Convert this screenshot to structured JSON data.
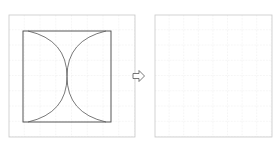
{
  "diagram": {
    "left_panel": {
      "label": "original figure on grid",
      "grid": {
        "x": 9,
        "y": 15,
        "width": 126,
        "height": 122,
        "cols": 8,
        "rows": 8
      },
      "square": {
        "x": 23,
        "y": 31,
        "width": 88,
        "height": 91
      },
      "arcs": "two quarter-circle-like arcs meeting at center, forming an hourglass shape"
    },
    "arrow": {
      "direction": "right",
      "label": "transform-arrow"
    },
    "right_panel": {
      "label": "empty grid for drawing",
      "grid": {
        "x": 155,
        "y": 15,
        "width": 117,
        "height": 122,
        "cols": 8,
        "rows": 8
      }
    },
    "colors": {
      "grid_line": "#d8d8d8",
      "border": "#c8c8c8",
      "figure_stroke": "#444444"
    }
  }
}
